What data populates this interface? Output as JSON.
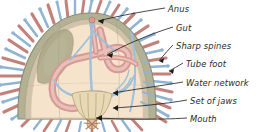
{
  "figure": {
    "background_color": "#ffffff"
  },
  "palette": {
    "spine_red": "#c2817a",
    "spine_red_dark": "#a9655f",
    "tube_foot_blue": "#8fb4d4",
    "tube_foot_blue_dark": "#6f9bc4",
    "body_cavity_cream": "#f6e3cd",
    "gut_pink": "#d79a93",
    "gut_pink_light": "#e7b9b2",
    "test_wall_olive": "#9b9a80",
    "test_wall_olive_light": "#b3b194",
    "water_network_blue": "#9dc0dd",
    "jaw_cream": "#e8d9b6",
    "jaw_outline": "#b9a673",
    "leader_line": "#1a1a1a",
    "label_text": "#2b2b2b",
    "mouth_brown": "#b0805f"
  },
  "labels": [
    {
      "id": "anus",
      "text": "Anus",
      "x": 168,
      "y": 4,
      "target_x": 95,
      "target_y": 22
    },
    {
      "id": "gut",
      "text": "Gut",
      "x": 176,
      "y": 23,
      "target_x": 104,
      "target_y": 55
    },
    {
      "id": "sharp-spines",
      "text": "Sharp spines",
      "x": 176,
      "y": 41,
      "target_x": 158,
      "target_y": 60
    },
    {
      "id": "tube-foot",
      "text": "Tube foot",
      "x": 186,
      "y": 59,
      "target_x": 168,
      "target_y": 70
    },
    {
      "id": "water-network",
      "text": "Water network",
      "x": 186,
      "y": 78,
      "target_x": 110,
      "target_y": 92
    },
    {
      "id": "set-of-jaws",
      "text": "Set of jaws",
      "x": 190,
      "y": 96,
      "target_x": 108,
      "target_y": 108
    },
    {
      "id": "mouth",
      "text": "Mouth",
      "x": 190,
      "y": 114,
      "target_x": 92,
      "target_y": 117
    }
  ],
  "anatomy": {
    "anus_label": "Anus",
    "gut_label": "Gut",
    "sharp_spines_label": "Sharp spines",
    "tube_foot_label": "Tube foot",
    "water_network_label": "Water network",
    "set_of_jaws_label": "Set of jaws",
    "mouth_label": "Mouth"
  }
}
